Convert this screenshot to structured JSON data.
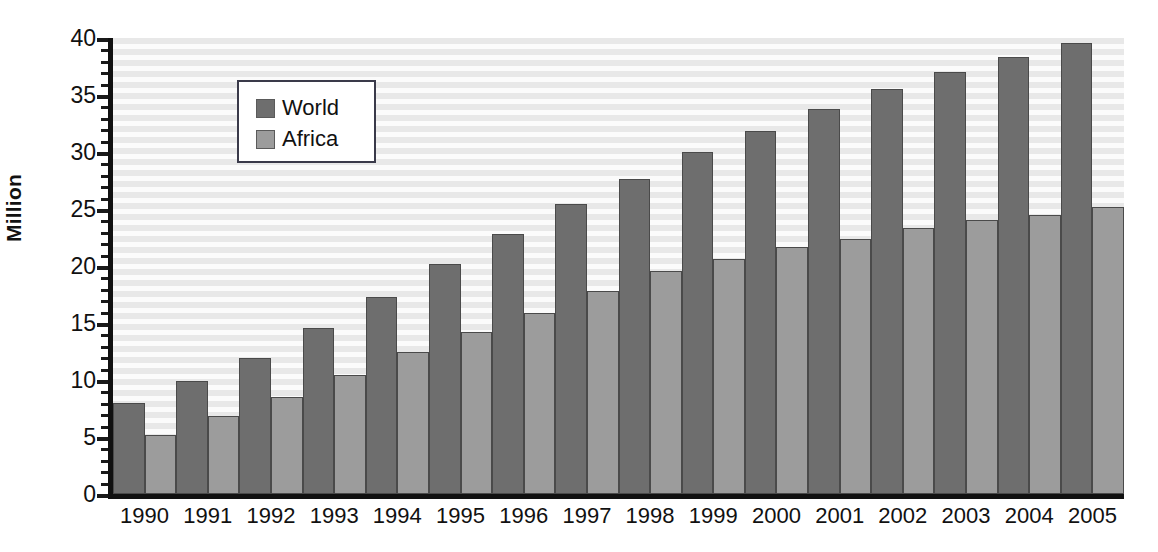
{
  "chart_data": {
    "type": "bar",
    "title": "",
    "subtitle": "",
    "xlabel": "",
    "ylabel": "Million",
    "ylim": [
      0,
      40
    ],
    "y_ticks": [
      0,
      5,
      10,
      15,
      20,
      25,
      30,
      35,
      40
    ],
    "y_minor_tick_step": 1,
    "grid": true,
    "grid_style": "horizontal-stripes",
    "legend_position": "inside-top-left",
    "categories": [
      "1990",
      "1991",
      "1992",
      "1993",
      "1994",
      "1995",
      "1996",
      "1997",
      "1998",
      "1999",
      "2000",
      "2001",
      "2002",
      "2003",
      "2004",
      "2005"
    ],
    "series": [
      {
        "name": "World",
        "color": "#6e6e6e",
        "values": [
          8.0,
          9.9,
          11.9,
          14.6,
          17.3,
          20.2,
          22.8,
          25.4,
          27.6,
          30.0,
          31.8,
          33.8,
          35.5,
          37.0,
          38.3,
          39.6
        ]
      },
      {
        "name": "Africa",
        "color": "#9c9c9c",
        "values": [
          5.2,
          6.8,
          8.5,
          10.4,
          12.5,
          14.2,
          15.9,
          17.8,
          19.6,
          20.6,
          21.7,
          22.4,
          23.3,
          24.0,
          24.5,
          25.2
        ]
      }
    ]
  },
  "axis": {
    "y_title": "Million"
  },
  "legend": {
    "items": [
      {
        "label": "World",
        "color": "#6e6e6e"
      },
      {
        "label": "Africa",
        "color": "#9c9c9c"
      }
    ]
  },
  "colors": {
    "world": "#6e6e6e",
    "africa": "#9c9c9c",
    "axis": "#111111",
    "plot_background_dark_stripe": "#e8e8e8",
    "plot_background_light_stripe": "#fbfbfb",
    "legend_border": "#3a3a4a"
  }
}
